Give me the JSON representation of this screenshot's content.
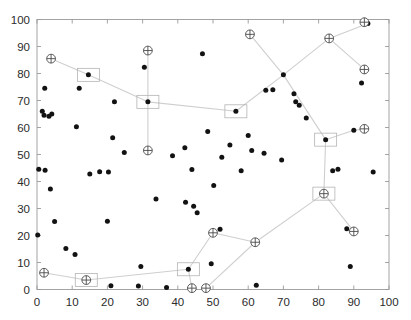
{
  "chart_data": {
    "type": "scatter",
    "title": "",
    "xlabel": "",
    "ylabel": "",
    "xlim": [
      0,
      100
    ],
    "ylim": [
      0,
      100
    ],
    "xticks": [
      0,
      10,
      20,
      30,
      40,
      50,
      60,
      70,
      80,
      90,
      100
    ],
    "yticks": [
      0,
      10,
      20,
      30,
      40,
      50,
      60,
      70,
      80,
      90,
      100
    ],
    "xtick_labels": [
      "0",
      "10",
      "20",
      "30",
      "40",
      "50",
      "60",
      "70",
      "80",
      "90",
      "100"
    ],
    "ytick_labels": [
      "0",
      "10",
      "20",
      "30",
      "40",
      "50",
      "60",
      "70",
      "80",
      "90",
      "100"
    ],
    "grid": false,
    "legend": null,
    "series": [
      {
        "name": "data-points",
        "marker": "filled-circle",
        "color": "#121212",
        "points": [
          [
            0.5,
            44.5
          ],
          [
            0.2,
            20.2
          ],
          [
            2.2,
            74.5
          ],
          [
            2.0,
            64.5
          ],
          [
            1.5,
            66.0
          ],
          [
            2.3,
            44.2
          ],
          [
            3.8,
            37.2
          ],
          [
            4.2,
            65.0
          ],
          [
            3.4,
            64.2
          ],
          [
            5.0,
            25.2
          ],
          [
            8.2,
            15.2
          ],
          [
            10.8,
            13.0
          ],
          [
            11.2,
            60.3
          ],
          [
            12.0,
            74.5
          ],
          [
            14.6,
            79.5
          ],
          [
            15.0,
            42.8
          ],
          [
            17.8,
            43.6
          ],
          [
            20.0,
            25.3
          ],
          [
            20.3,
            43.5
          ],
          [
            21.0,
            1.4
          ],
          [
            21.5,
            56.2
          ],
          [
            22.0,
            69.5
          ],
          [
            24.8,
            50.7
          ],
          [
            28.8,
            1.3
          ],
          [
            29.5,
            8.5
          ],
          [
            30.5,
            82.3
          ],
          [
            31.5,
            69.5
          ],
          [
            33.8,
            33.5
          ],
          [
            36.8,
            0.7
          ],
          [
            38.5,
            49.5
          ],
          [
            42.0,
            52.5
          ],
          [
            42.2,
            32.3
          ],
          [
            43.0,
            7.5
          ],
          [
            44.0,
            44.4
          ],
          [
            44.5,
            30.8
          ],
          [
            45.5,
            28.4
          ],
          [
            47.0,
            87.3
          ],
          [
            48.5,
            58.5
          ],
          [
            49.5,
            9.5
          ],
          [
            50.2,
            38.5
          ],
          [
            52.5,
            49.0
          ],
          [
            52.0,
            22.3
          ],
          [
            54.8,
            53.5
          ],
          [
            56.5,
            66.0
          ],
          [
            58.0,
            44.0
          ],
          [
            60.0,
            57.0
          ],
          [
            61.0,
            51.5
          ],
          [
            62.3,
            1.6
          ],
          [
            64.5,
            50.5
          ],
          [
            65.0,
            73.8
          ],
          [
            67.0,
            74.0
          ],
          [
            69.5,
            48.0
          ],
          [
            70.0,
            79.5
          ],
          [
            73.0,
            72.5
          ],
          [
            73.5,
            69.5
          ],
          [
            74.5,
            68.2
          ],
          [
            76.5,
            63.5
          ],
          [
            81.5,
            35.5
          ],
          [
            82.0,
            55.5
          ],
          [
            83.0,
            92.8
          ],
          [
            84.0,
            44.0
          ],
          [
            85.5,
            44.5
          ],
          [
            88.0,
            22.5
          ],
          [
            89.0,
            8.5
          ],
          [
            90.0,
            59.0
          ],
          [
            92.2,
            76.5
          ],
          [
            94.0,
            98.5
          ],
          [
            95.5,
            43.5
          ]
        ]
      },
      {
        "name": "circled-plus-nodes",
        "marker": "circle-plus",
        "color": "#4a4a4a",
        "points": [
          [
            4.0,
            85.5
          ],
          [
            31.5,
            88.5
          ],
          [
            31.5,
            51.5
          ],
          [
            60.5,
            94.5
          ],
          [
            83.0,
            93.0
          ],
          [
            93.0,
            99.0
          ],
          [
            93.0,
            81.5
          ],
          [
            93.0,
            59.5
          ],
          [
            81.5,
            35.5
          ],
          [
            90.0,
            21.5
          ],
          [
            62.0,
            17.5
          ],
          [
            50.0,
            21.0
          ],
          [
            44.0,
            0.5
          ],
          [
            48.0,
            0.5
          ],
          [
            2.0,
            6.2
          ],
          [
            14.0,
            3.5
          ]
        ]
      },
      {
        "name": "boxed-nodes",
        "marker": "square-outline",
        "color": "#b4b4b4",
        "points": [
          [
            14.6,
            79.5
          ],
          [
            31.5,
            69.5
          ],
          [
            43.0,
            7.5
          ],
          [
            56.5,
            66.0
          ],
          [
            81.5,
            35.5
          ],
          [
            82.0,
            55.5
          ],
          [
            14.0,
            3.5
          ]
        ]
      }
    ],
    "edges": [
      [
        [
          4.0,
          85.5
        ],
        [
          14.6,
          79.5
        ]
      ],
      [
        [
          14.6,
          79.5
        ],
        [
          31.5,
          69.5
        ]
      ],
      [
        [
          31.5,
          88.5
        ],
        [
          31.5,
          69.5
        ]
      ],
      [
        [
          31.5,
          69.5
        ],
        [
          31.5,
          51.5
        ]
      ],
      [
        [
          31.5,
          69.5
        ],
        [
          56.5,
          66.0
        ]
      ],
      [
        [
          56.5,
          66.0
        ],
        [
          70.0,
          79.5
        ]
      ],
      [
        [
          60.5,
          94.5
        ],
        [
          70.0,
          79.5
        ]
      ],
      [
        [
          70.0,
          79.5
        ],
        [
          83.0,
          93.0
        ]
      ],
      [
        [
          83.0,
          93.0
        ],
        [
          94.0,
          98.5
        ]
      ],
      [
        [
          94.0,
          98.5
        ],
        [
          93.0,
          99.0
        ]
      ],
      [
        [
          83.0,
          93.0
        ],
        [
          93.0,
          81.5
        ]
      ],
      [
        [
          70.0,
          79.5
        ],
        [
          82.0,
          55.5
        ]
      ],
      [
        [
          82.0,
          55.5
        ],
        [
          90.0,
          59.0
        ]
      ],
      [
        [
          90.0,
          59.0
        ],
        [
          93.0,
          59.5
        ]
      ],
      [
        [
          82.0,
          55.5
        ],
        [
          81.5,
          35.5
        ]
      ],
      [
        [
          81.5,
          35.5
        ],
        [
          90.0,
          21.5
        ]
      ],
      [
        [
          81.5,
          35.5
        ],
        [
          62.0,
          17.5
        ]
      ],
      [
        [
          62.0,
          17.5
        ],
        [
          50.0,
          21.0
        ]
      ],
      [
        [
          50.0,
          21.0
        ],
        [
          43.0,
          7.5
        ]
      ],
      [
        [
          62.0,
          17.5
        ],
        [
          48.0,
          0.5
        ]
      ],
      [
        [
          43.0,
          7.5
        ],
        [
          44.0,
          0.5
        ]
      ],
      [
        [
          43.0,
          7.5
        ],
        [
          14.0,
          3.5
        ]
      ],
      [
        [
          14.0,
          3.5
        ],
        [
          2.0,
          6.2
        ]
      ]
    ]
  },
  "axes": {
    "x_tick_labels": [
      "0",
      "10",
      "20",
      "30",
      "40",
      "50",
      "60",
      "70",
      "80",
      "90",
      "100"
    ],
    "y_tick_labels": [
      "0",
      "10",
      "20",
      "30",
      "40",
      "50",
      "60",
      "70",
      "80",
      "90",
      "100"
    ]
  },
  "colors": {
    "point": "#121212",
    "edge": "#cfcfcf",
    "marker_stroke": "#4a4a4a",
    "box_stroke": "#b4b4b4",
    "axis": "#9a9a9a",
    "label": "#2b2b2b",
    "background": "#ffffff"
  }
}
